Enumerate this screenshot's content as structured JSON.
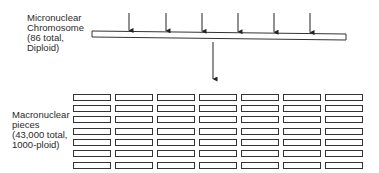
{
  "micronuclear": {
    "label_lines": [
      "Micronuclear",
      "Chromosome",
      "(86 total,",
      "Diploid)"
    ],
    "bar": {
      "x1": 92,
      "x2": 346,
      "y_left": 31,
      "y_right": 34,
      "height": 6
    },
    "cut_arrows_x": [
      129,
      166,
      202,
      238,
      274,
      310
    ]
  },
  "macronuclear": {
    "label_lines": [
      "Macronuclear",
      "pieces",
      "(43,000 total,",
      "1000-ploid)"
    ],
    "grid": {
      "columns": 7,
      "rows": 7,
      "col_x": [
        73,
        115,
        157,
        199,
        241,
        283,
        325
      ],
      "row_y": [
        94,
        105,
        116,
        128,
        139,
        150,
        162
      ],
      "piece_width": 37,
      "piece_height": 6
    }
  },
  "transition_arrow": {
    "x": 213,
    "y1": 42,
    "y2": 79
  },
  "colors": {
    "stroke": "#333333",
    "text": "#2a2a2a",
    "background": "#ffffff"
  }
}
